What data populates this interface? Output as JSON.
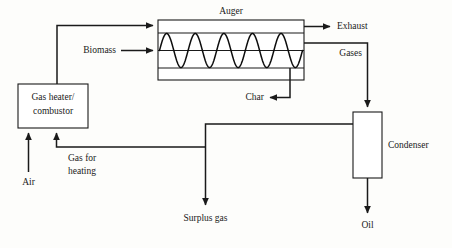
{
  "diagram": {
    "type": "process-flow-diagram",
    "background_color": "#fdfdfb",
    "line_color": "#1a1a1a",
    "text_color": "#1a1a1a"
  },
  "units": {
    "auger": {
      "label": "Auger",
      "screw_periods": 5
    },
    "gas_heater": {
      "line1": "Gas heater/",
      "line2": "combustor"
    },
    "condenser": {
      "label": "Condenser"
    }
  },
  "streams": {
    "biomass": {
      "label": "Biomass"
    },
    "exhaust": {
      "label": "Exhaust"
    },
    "gases": {
      "label": "Gases"
    },
    "char": {
      "label": "Char"
    },
    "air": {
      "label": "Air"
    },
    "gas_for_heating": {
      "line1": "Gas for",
      "line2": "heating"
    },
    "surplus_gas": {
      "label": "Surplus gas"
    },
    "oil": {
      "label": "Oil"
    }
  }
}
